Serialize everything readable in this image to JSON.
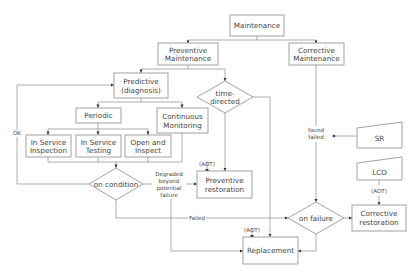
{
  "diagram": {
    "type": "flowchart",
    "nodes": {
      "maintenance": {
        "label": "Maintenance"
      },
      "preventive": {
        "line1": "Preventive",
        "line2": "Maintenance"
      },
      "corrective": {
        "line1": "Corrective",
        "line2": "Maintenance"
      },
      "predictive": {
        "line1": "Predictive",
        "line2": "(diagnosis)"
      },
      "time_directed": {
        "line1": "time-",
        "line2": "directed"
      },
      "periodic": {
        "label": "Periodic"
      },
      "continuous": {
        "line1": "Continuous",
        "line2": "Monitoring"
      },
      "isi": {
        "line1": "In Service",
        "line2": "Inspection"
      },
      "ist": {
        "line1": "In Service",
        "line2": "Testing"
      },
      "open_inspect": {
        "line1": "Open and",
        "line2": "Inspect"
      },
      "on_condition": {
        "label": "on condition"
      },
      "preventive_restoration": {
        "line1": "Preventive",
        "line2": "restoration"
      },
      "sr": {
        "label": "SR"
      },
      "lco": {
        "label": "LCO"
      },
      "on_failure": {
        "label": "on failure"
      },
      "corrective_restoration": {
        "line1": "Corrective",
        "line2": "restoration"
      },
      "replacement": {
        "label": "Replacement"
      }
    },
    "edge_labels": {
      "ok": "OK",
      "degraded1": "Degraded",
      "degraded2": "beyond",
      "degraded3": "potential",
      "degraded4": "failure",
      "failed": "Failed",
      "found1": "found",
      "found2": "failed",
      "aot_prev": "(AOT)",
      "aot_repl": "(AOT)",
      "aot_corr": "(AOT)"
    }
  }
}
